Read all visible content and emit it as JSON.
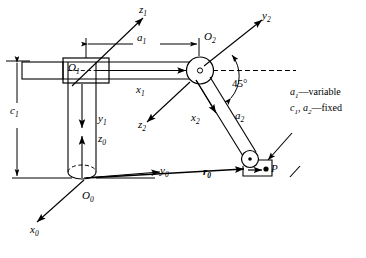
{
  "figure": {
    "type": "kinematic-diagram",
    "background_color": "#ffffff",
    "line_color": "#000000"
  },
  "frames": [
    {
      "origin_label": "O",
      "origin_sub": "0",
      "axes": [
        {
          "name": "x",
          "sub": "0",
          "label": "x0"
        },
        {
          "name": "y",
          "sub": "0",
          "label": "y0"
        },
        {
          "name": "z",
          "sub": "0",
          "label": "z0"
        }
      ]
    },
    {
      "origin_label": "O",
      "origin_sub": "1",
      "axes": [
        {
          "name": "x",
          "sub": "1",
          "label": "x1"
        },
        {
          "name": "y",
          "sub": "1",
          "label": "y1"
        },
        {
          "name": "z",
          "sub": "1",
          "label": "z1"
        }
      ]
    },
    {
      "origin_label": "O",
      "origin_sub": "2",
      "axes": [
        {
          "name": "x",
          "sub": "2",
          "label": "x2"
        },
        {
          "name": "y",
          "sub": "2",
          "label": "y2"
        },
        {
          "name": "z",
          "sub": "2",
          "label": "z2"
        }
      ]
    }
  ],
  "labels": {
    "O0": {
      "base": "O",
      "sub": "0"
    },
    "O1": {
      "base": "O",
      "sub": "1"
    },
    "O2": {
      "base": "O",
      "sub": "2"
    },
    "x0": {
      "base": "x",
      "sub": "0"
    },
    "y0": {
      "base": "y",
      "sub": "0"
    },
    "z0": {
      "base": "z",
      "sub": "0"
    },
    "x1": {
      "base": "x",
      "sub": "1"
    },
    "y1": {
      "base": "y",
      "sub": "1"
    },
    "z1": {
      "base": "z",
      "sub": "1"
    },
    "x2": {
      "base": "x",
      "sub": "2"
    },
    "y2": {
      "base": "y",
      "sub": "2"
    },
    "z2": {
      "base": "z",
      "sub": "2"
    },
    "a1": {
      "base": "a",
      "sub": "1"
    },
    "a2": {
      "base": "a",
      "sub": "2"
    },
    "c1": {
      "base": "c",
      "sub": "1"
    },
    "r0": {
      "base": "r",
      "sub": "0"
    },
    "P": {
      "base": "P",
      "sub": ""
    }
  },
  "dimensions": {
    "a1": "a1",
    "a2": "a2",
    "c1": "c1",
    "r0": "r0"
  },
  "angle": {
    "value": "45",
    "unit": "°",
    "text": "45°"
  },
  "point": {
    "name": "P",
    "label": "P"
  },
  "legend": {
    "lines": [
      {
        "symbols": "a1",
        "dash": "—",
        "text": "variable"
      },
      {
        "symbols": "c1, a2",
        "dash": "—",
        "text": "fixed"
      }
    ],
    "line1_sym_base": "a",
    "line1_sym_sub": "1",
    "line1_dash": "—",
    "line1_text": "variable",
    "line2_sym1_base": "c",
    "line2_sym1_sub": "1",
    "line2_comma": ", ",
    "line2_sym2_base": "a",
    "line2_sym2_sub": "2",
    "line2_dash": "—",
    "line2_text": "fixed"
  },
  "joints": [
    {
      "name": "prismatic-joint-1",
      "at": "O1",
      "type": "prismatic"
    },
    {
      "name": "revolute-joint-2",
      "at": "O2",
      "type": "revolute"
    },
    {
      "name": "revolute-joint-3",
      "at": "P",
      "type": "revolute"
    }
  ]
}
